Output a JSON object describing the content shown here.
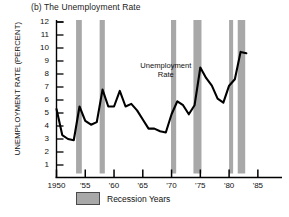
{
  "figure": {
    "title": "(b) The Unemployment Rate",
    "ylabel": "UNEMPLOYMENT RATE (PERCENT)",
    "annotation_line1": "Unemployment",
    "annotation_line2": "Rate",
    "legend_label": "Recession Years",
    "legend_swatch_color": "#a8a8a8",
    "line_color": "#000000"
  },
  "chart_data": {
    "type": "line",
    "title": "(b) The Unemployment Rate",
    "xlabel": "",
    "ylabel": "UNEMPLOYMENT RATE (PERCENT)",
    "xlim": [
      1950,
      1988
    ],
    "ylim": [
      0.6,
      12
    ],
    "grid": false,
    "legend_position": "below-axis",
    "ytick_labels": [
      "12",
      "11",
      "10",
      "9",
      "8",
      "7",
      "6",
      "5",
      "4",
      "3",
      "2",
      "1"
    ],
    "ytick_values": [
      12,
      11,
      10,
      9,
      8,
      7,
      6,
      5,
      4,
      3,
      2,
      1
    ],
    "xtick_labels": [
      "1950",
      "'55",
      "'60",
      "'65",
      "'70",
      "'75",
      "'80",
      "'85"
    ],
    "xtick_values": [
      1950,
      1955,
      1960,
      1965,
      1970,
      1975,
      1980,
      1985
    ],
    "series": [
      {
        "name": "Unemployment Rate",
        "x": [
          1950,
          1951,
          1952,
          1953,
          1954,
          1955,
          1956,
          1957,
          1958,
          1959,
          1960,
          1961,
          1962,
          1963,
          1964,
          1965,
          1966,
          1967,
          1968,
          1969,
          1970,
          1971,
          1972,
          1973,
          1974,
          1975,
          1976,
          1977,
          1978,
          1979,
          1980,
          1981,
          1982,
          1983
        ],
        "values": [
          5.3,
          3.3,
          3.0,
          2.9,
          5.5,
          4.4,
          4.1,
          4.3,
          6.8,
          5.5,
          5.5,
          6.7,
          5.5,
          5.7,
          5.2,
          4.5,
          3.8,
          3.8,
          3.6,
          3.5,
          4.9,
          5.9,
          5.6,
          4.9,
          5.6,
          8.5,
          7.7,
          7.1,
          6.1,
          5.8,
          7.1,
          7.6,
          9.7,
          9.6
        ]
      }
    ],
    "recession_bands": [
      {
        "start": 1953.4,
        "end": 1954.4
      },
      {
        "start": 1957.5,
        "end": 1958.4
      },
      {
        "start": 1969.9,
        "end": 1970.8
      },
      {
        "start": 1973.8,
        "end": 1975.2
      },
      {
        "start": 1980.0,
        "end": 1980.7
      },
      {
        "start": 1981.5,
        "end": 1982.8
      }
    ],
    "annotations": [
      {
        "text": "Unemployment Rate",
        "x": 1969,
        "y": 8.6
      }
    ]
  }
}
